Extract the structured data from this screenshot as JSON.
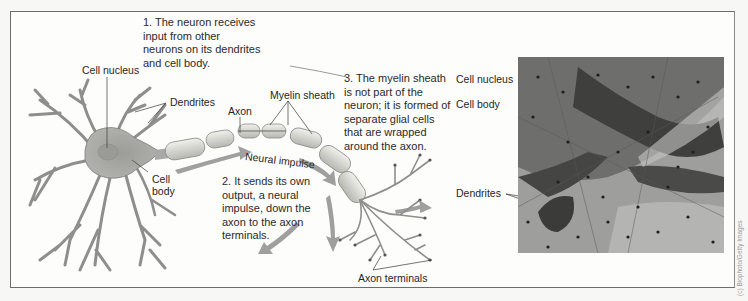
{
  "figure": {
    "left_panel": {
      "labels": {
        "cell_nucleus": "Cell nucleus",
        "dendrites": "Dendrites",
        "axon": "Axon",
        "myelin_sheath": "Myelin sheath",
        "cell_body_line1": "Cell",
        "cell_body_line2": "body",
        "neural_impulse": "Neural impulse",
        "axon_terminals": "Axon terminals"
      },
      "notes": {
        "note1": "1. The neuron receives\ninput from other\nneurons on its dendrites\nand cell body.",
        "note2": "2. It sends its own\noutput, a neural\nimpulse, down the\naxon to the axon\nterminals.",
        "note3": "3. The myelin sheath\nis not part of the\nneuron; it is formed of\nseparate glial cells\nthat are wrapped\naround the axon."
      }
    },
    "right_panel": {
      "labels": {
        "cell_nucleus": "Cell nucleus",
        "cell_body": "Cell body",
        "dendrites": "Dendrites"
      },
      "photo_alt": "Micrograph of stained neurons"
    },
    "credit": "(c) Biophoto/Getty Images",
    "colors": {
      "frame_border": "#6c6c6c",
      "neuron_fill": "#a9a9a7",
      "myelin_fill": "#d9d9d4",
      "arrow_fill": "#8f8f8f",
      "text": "#262626"
    }
  }
}
